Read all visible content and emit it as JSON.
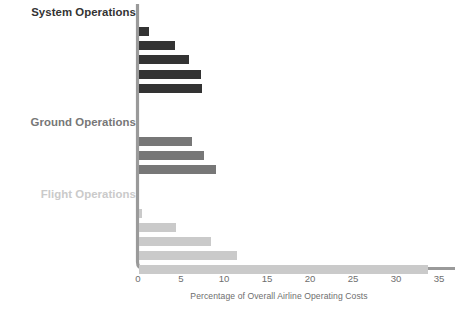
{
  "chart_data": {
    "type": "bar",
    "orientation": "horizontal",
    "title": "",
    "xlabel": "Percentage of Overall Airline Operating Costs",
    "ylabel": "",
    "xlim": [
      0,
      36.5
    ],
    "xticks": [
      0,
      5,
      10,
      15,
      20,
      25,
      30,
      35
    ],
    "xtick_labels": [
      "0",
      "5",
      "10",
      "15",
      "20",
      "25",
      "30",
      "35"
    ],
    "grid": false,
    "legend": "none",
    "groups": [
      {
        "name": "System Operations",
        "color": "#333333",
        "categories": [
          "IT and communications",
          "Passenger service",
          "Flight attendant salaries",
          "General and administrative",
          "Reservations, ticketing, sales,\nand promotions"
        ],
        "values": [
          1.2,
          4.2,
          5.8,
          7.2,
          7.3
        ]
      },
      {
        "name": "Ground Operations",
        "color": "#777777",
        "categories": [
          "Airport charges",
          "Station and ground",
          "Maintenance and overhaul"
        ],
        "values": [
          6.2,
          7.5,
          9.0
        ]
      },
      {
        "name": "Flight Operations",
        "color": "#cacaca",
        "categories": [
          "Flight equipment insurance",
          "Air navigation charges",
          "Pilot salaries",
          "Aircraft ownership",
          "Fuel and oil"
        ],
        "values": [
          0.4,
          4.3,
          8.4,
          11.4,
          33.6
        ]
      }
    ]
  },
  "axis": {
    "spine_color": "#9a9a9a",
    "label_color": "#8c8c8c",
    "tick_color": "#6e6e6e"
  }
}
